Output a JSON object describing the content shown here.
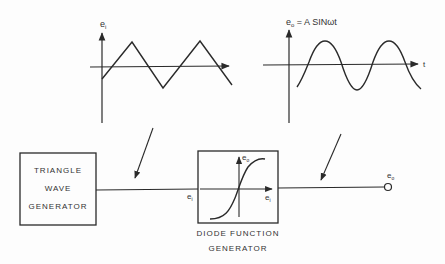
{
  "input_graph": {
    "y_label": "e",
    "y_label_sub": "i",
    "shape": "triangle wave",
    "points": [
      [
        102,
        79
      ],
      [
        132,
        42
      ],
      [
        163,
        88
      ],
      [
        200,
        41
      ],
      [
        232,
        85
      ]
    ]
  },
  "output_graph": {
    "y_label": "e",
    "y_label_sub": "o",
    "formula_rest": " = A  SINωt",
    "x_label": "t",
    "shape": "sine wave"
  },
  "triangle_block": {
    "lines": [
      "TRIANGLE",
      "WAVE",
      "GENERATOR"
    ]
  },
  "diode_block": {
    "caption_lines": [
      "DIODE  FUNCTION",
      "GENERATOR"
    ],
    "inner_y_label": "e",
    "inner_y_sub": "o",
    "inner_x_label": "e",
    "inner_x_sub": "i"
  },
  "wire_labels": {
    "input": "e",
    "input_sub": "i",
    "output": "e",
    "output_sub": "o"
  },
  "colors": {
    "ink": "#2a2a2a",
    "background": "#fdfdfd"
  }
}
